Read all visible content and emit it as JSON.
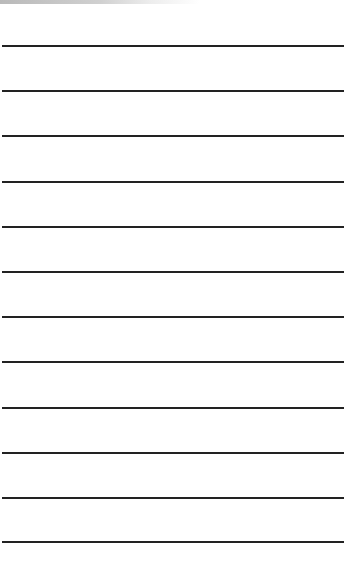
{
  "paper": {
    "background": "#ffffff",
    "line_color": "#222222",
    "line_count": 12,
    "line_positions_px": [
      45,
      90,
      135,
      181,
      226,
      271,
      316,
      361,
      407,
      452,
      497,
      541
    ]
  }
}
